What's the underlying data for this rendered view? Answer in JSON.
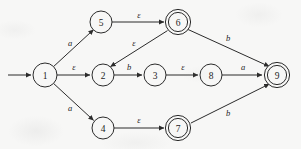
{
  "figure": {
    "kind": "nfa-state-diagram",
    "width": 301,
    "height": 149,
    "background_color": "#f7f7f6",
    "ink_color": "#2b2b2b",
    "start_marker": "arrow-into-state-1"
  },
  "states": [
    {
      "id": "1",
      "label": "1",
      "cx": 45,
      "cy": 75,
      "r": 12,
      "accepting": false
    },
    {
      "id": "5",
      "label": "5",
      "cx": 101,
      "cy": 22,
      "r": 11,
      "accepting": false
    },
    {
      "id": "6",
      "label": "6",
      "cx": 178,
      "cy": 22,
      "r": 11,
      "accepting": true
    },
    {
      "id": "2",
      "label": "2",
      "cx": 103,
      "cy": 75,
      "r": 11,
      "accepting": false
    },
    {
      "id": "3",
      "label": "3",
      "cx": 155,
      "cy": 75,
      "r": 11,
      "accepting": false
    },
    {
      "id": "8",
      "label": "8",
      "cx": 211,
      "cy": 75,
      "r": 11,
      "accepting": false
    },
    {
      "id": "9",
      "label": "9",
      "cx": 277,
      "cy": 75,
      "r": 11,
      "accepting": true
    },
    {
      "id": "4",
      "label": "4",
      "cx": 103,
      "cy": 128,
      "r": 11,
      "accepting": false
    },
    {
      "id": "7",
      "label": "7",
      "cx": 178,
      "cy": 128,
      "r": 11,
      "accepting": true
    }
  ],
  "transitions": [
    {
      "from": "1",
      "to": "5",
      "label": "a",
      "label_x": 70,
      "label_y": 43
    },
    {
      "from": "5",
      "to": "6",
      "label": "ε",
      "label_x": 139,
      "label_y": 15
    },
    {
      "from": "1",
      "to": "2",
      "label": "ε",
      "label_x": 74,
      "label_y": 67
    },
    {
      "from": "6",
      "to": "2",
      "label": "ε",
      "label_x": 134,
      "label_y": 43
    },
    {
      "from": "2",
      "to": "3",
      "label": "b",
      "label_x": 129,
      "label_y": 67
    },
    {
      "from": "3",
      "to": "8",
      "label": "ε",
      "label_x": 183,
      "label_y": 67
    },
    {
      "from": "8",
      "to": "9",
      "label": "a",
      "label_x": 243,
      "label_y": 67
    },
    {
      "from": "6",
      "to": "9",
      "label": "b",
      "label_x": 228,
      "label_y": 38
    },
    {
      "from": "1",
      "to": "4",
      "label": "a",
      "label_x": 70,
      "label_y": 108
    },
    {
      "from": "4",
      "to": "7",
      "label": "ε",
      "label_x": 139,
      "label_y": 120
    },
    {
      "from": "7",
      "to": "9",
      "label": "b",
      "label_x": 228,
      "label_y": 113
    }
  ]
}
